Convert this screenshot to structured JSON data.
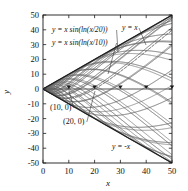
{
  "chart_data": {
    "type": "line",
    "title": "",
    "xlabel": "x",
    "ylabel": "y",
    "xlim": [
      0,
      50
    ],
    "ylim": [
      -50,
      50
    ],
    "xticks": [
      0,
      10,
      20,
      30,
      40,
      50
    ],
    "yticks": [
      50,
      40,
      30,
      20,
      10,
      0,
      -10,
      -20,
      -30,
      -40,
      -50
    ],
    "xticklabels": [
      "0",
      "10",
      "20",
      "30",
      "40",
      "50"
    ],
    "yticklabels": [
      "50",
      "40",
      "30",
      "20",
      "10",
      "0",
      "-10",
      "-20",
      "-30",
      "-40",
      "-50"
    ],
    "grid": false,
    "legend_position": "none",
    "frame": "box",
    "tick_direction": "in",
    "series": [
      {
        "name": "y = x sin(ln(x/20))",
        "formula": "x*sin(log(x/20))",
        "a": 20,
        "style": "dashed",
        "color": "#3a3a3a",
        "zero_crossing": [
          20,
          0
        ]
      },
      {
        "name": "y = x sin(ln(x/10))",
        "formula": "x*sin(log(x/10))",
        "a": 10,
        "style": "solid",
        "color": "#4a4a4a",
        "zero_crossing": [
          10,
          0
        ]
      },
      {
        "name": "y = x",
        "formula": "x",
        "style": "solid",
        "color": "#2a2a2a",
        "envelope": "upper"
      },
      {
        "name": "y = -x",
        "formula": "-x",
        "style": "solid",
        "color": "#2a2a2a",
        "envelope": "lower"
      }
    ],
    "curve_family": {
      "description": "y = x sin(ln(x/a)) for a family of constants a",
      "a_values": [
        20,
        14,
        10,
        7,
        5,
        3.5,
        2.5,
        1.8,
        1.25,
        0.9,
        0.62,
        0.44,
        0.3,
        0.21,
        0.15,
        0.105,
        0.072,
        0.05,
        0.035,
        0.024,
        0.017,
        0.012,
        0.008
      ],
      "color": "#5a5a5a"
    },
    "annotations": [
      {
        "text": "y = x sin(ln(x/20))",
        "x_px": 52,
        "y_px": 32,
        "leader_to": [
          118,
          52
        ]
      },
      {
        "text": "y = x sin(ln(x/10))",
        "x_px": 52,
        "y_px": 45,
        "leader_to": [
          108,
          74
        ]
      },
      {
        "text": "y = x",
        "x_px": 122,
        "y_px": 30,
        "leader_to": [
          146,
          45
        ]
      },
      {
        "text": "(10, 0)",
        "x_px": 50,
        "y_px": 110,
        "leader_to": [
          69,
          91
        ]
      },
      {
        "text": "(20, 0)",
        "x_px": 63,
        "y_px": 124,
        "leader_to": [
          95,
          91
        ]
      },
      {
        "text": "y = -x",
        "x_px": 112,
        "y_px": 149
      }
    ],
    "zero_markers": [
      {
        "x": 10,
        "y": 0
      },
      {
        "x": 20,
        "y": 0
      },
      {
        "x": 30,
        "y": 0
      },
      {
        "x": 40,
        "y": 0
      },
      {
        "x": 50,
        "y": 0
      }
    ]
  }
}
